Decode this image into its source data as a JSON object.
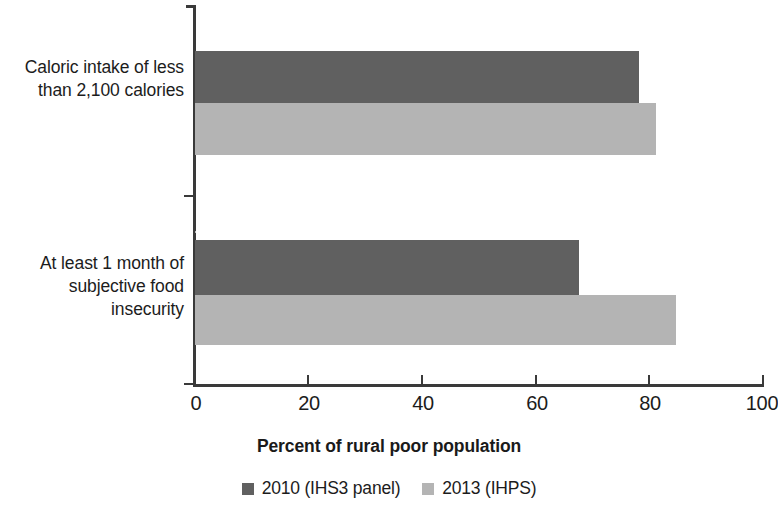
{
  "chart_data": {
    "type": "bar",
    "orientation": "horizontal",
    "title": "",
    "xlabel": "Percent of rural poor population",
    "ylabel": "",
    "xlim": [
      0,
      100
    ],
    "xticks": [
      0,
      20,
      40,
      60,
      80,
      100
    ],
    "xtick_labels": [
      "0",
      "20",
      "40",
      "60",
      "80",
      "100"
    ],
    "grid": false,
    "legend_position": "bottom-center",
    "categories": [
      "Caloric intake of less\nthan 2,100 calories",
      "At least 1 month of\nsubjective food\ninsecurity"
    ],
    "series": [
      {
        "name": "2010 (IHS3 panel)",
        "color": "#606060",
        "values": [
          78,
          67.5
        ]
      },
      {
        "name": "2013 (IHPS)",
        "color": "#b4b4b4",
        "values": [
          81,
          84.5
        ]
      }
    ]
  },
  "axis": {
    "title": "Percent of rural poor population",
    "ticks": [
      "0",
      "20",
      "40",
      "60",
      "80",
      "100"
    ]
  },
  "legend": {
    "items": [
      {
        "label": "2010 (IHS3 panel)",
        "color": "#606060"
      },
      {
        "label": "2013 (IHPS)",
        "color": "#b4b4b4"
      }
    ]
  },
  "categories": [
    {
      "label": "Caloric intake of less\nthan 2,100 calories"
    },
    {
      "label": "At least 1 month of\nsubjective food\ninsecurity"
    }
  ]
}
